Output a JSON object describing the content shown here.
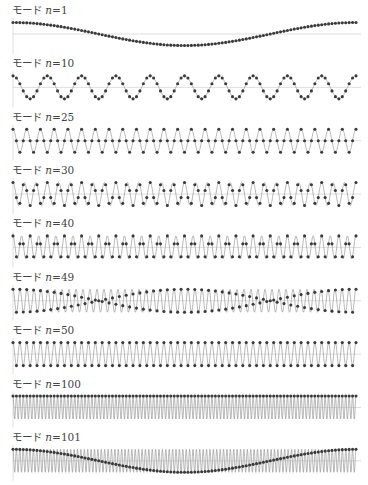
{
  "figure": {
    "colors": {
      "background": "#ffffff",
      "dot": "#3a3a3a",
      "curve": "#8a8a8a",
      "axis": "#d6d6d6",
      "label": "#444444"
    }
  },
  "chart_data": {
    "type": "line",
    "title": "",
    "xlabel": "",
    "ylabel": "",
    "num_points": 100,
    "x_range": [
      0,
      1
    ],
    "ylim": [
      -1,
      1
    ],
    "grid": false,
    "legend": "none",
    "formula": "y = cos(2*pi*n*x); dots at x = j/100, j = 0..100",
    "panels": [
      {
        "label_prefix": "モード ",
        "label_var": "n",
        "label_eq": "=1",
        "n": 1
      },
      {
        "label_prefix": "モード ",
        "label_var": "n",
        "label_eq": "=10",
        "n": 10
      },
      {
        "label_prefix": "モード ",
        "label_var": "n",
        "label_eq": "=25",
        "n": 25
      },
      {
        "label_prefix": "モード ",
        "label_var": "n",
        "label_eq": "=30",
        "n": 30
      },
      {
        "label_prefix": "モード ",
        "label_var": "n",
        "label_eq": "=40",
        "n": 40
      },
      {
        "label_prefix": "モード ",
        "label_var": "n",
        "label_eq": "=49",
        "n": 49
      },
      {
        "label_prefix": "モード ",
        "label_var": "n",
        "label_eq": "=50",
        "n": 50
      },
      {
        "label_prefix": "モード ",
        "label_var": "n",
        "label_eq": "=100",
        "n": 100
      },
      {
        "label_prefix": "モード ",
        "label_var": "n",
        "label_eq": "=101",
        "n": 101
      }
    ]
  }
}
